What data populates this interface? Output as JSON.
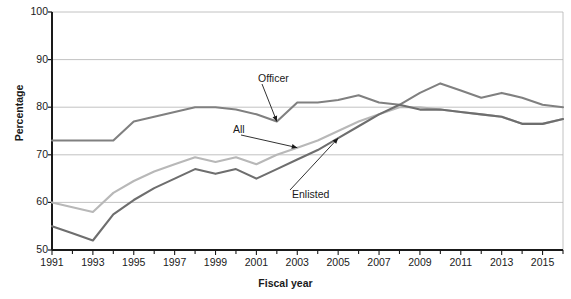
{
  "chart_data": {
    "type": "line",
    "title": "",
    "xlabel": "Fiscal year",
    "ylabel": "Percentage",
    "ylim": [
      50,
      100
    ],
    "xlim": [
      1991,
      2016
    ],
    "grid": true,
    "legend_position": "inline-annotations",
    "yticks": [
      50,
      60,
      70,
      80,
      90,
      100
    ],
    "xticks": [
      1991,
      1992,
      1993,
      1994,
      1995,
      1996,
      1997,
      1998,
      1999,
      2000,
      2001,
      2002,
      2003,
      2004,
      2005,
      2006,
      2007,
      2008,
      2009,
      2010,
      2011,
      2012,
      2013,
      2014,
      2015,
      2016
    ],
    "xtick_labels": [
      "1991",
      "",
      "1993",
      "",
      "1995",
      "",
      "1997",
      "",
      "1999",
      "",
      "2001",
      "",
      "2003",
      "",
      "2005",
      "",
      "2007",
      "",
      "2009",
      "",
      "2011",
      "",
      "2013",
      "",
      "2015",
      ""
    ],
    "x": [
      1991,
      1992,
      1993,
      1994,
      1995,
      1996,
      1997,
      1998,
      1999,
      2000,
      2001,
      2002,
      2003,
      2004,
      2005,
      2006,
      2007,
      2008,
      2009,
      2010,
      2011,
      2012,
      2013,
      2014,
      2015,
      2016
    ],
    "series": [
      {
        "name": "Officer",
        "color": "#808080",
        "values": [
          73,
          73,
          73,
          73,
          77,
          78,
          79,
          80,
          80,
          79.5,
          78.5,
          77,
          81,
          81,
          81.5,
          82.5,
          81,
          80.5,
          83,
          85,
          83.5,
          82,
          83,
          82,
          80.5,
          80
        ]
      },
      {
        "name": "All",
        "color": "#b8b8b8",
        "values": [
          60,
          59,
          58,
          62,
          64.5,
          66.5,
          68,
          69.5,
          68.5,
          69.5,
          68,
          70,
          71.5,
          73,
          75,
          77,
          78.5,
          80,
          80,
          79.5,
          79,
          78.5,
          78,
          76.5,
          76.5,
          77.5
        ]
      },
      {
        "name": "Enlisted",
        "color": "#6e6e6e",
        "values": [
          55,
          53.5,
          52,
          57.5,
          60.5,
          63,
          65,
          67,
          66,
          67,
          65,
          67,
          69,
          71,
          73.5,
          76,
          78.5,
          80.5,
          79.5,
          79.5,
          79,
          78.5,
          78,
          76.5,
          76.5,
          77.5
        ]
      }
    ],
    "annotations": [
      {
        "label": "Officer",
        "target_series": "Officer",
        "target_x": 2002,
        "target_y": 77
      },
      {
        "label": "All",
        "target_series": "All",
        "target_x": 2003,
        "target_y": 71.5
      },
      {
        "label": "Enlisted",
        "target_series": "Enlisted",
        "target_x": 2005,
        "target_y": 73.5
      }
    ]
  },
  "axis": {
    "y_title": "Percentage",
    "x_title": "Fiscal year"
  },
  "colors": {
    "axis": "#1a1a1a",
    "grid": "#b3b3b3",
    "background": "#ffffff"
  }
}
